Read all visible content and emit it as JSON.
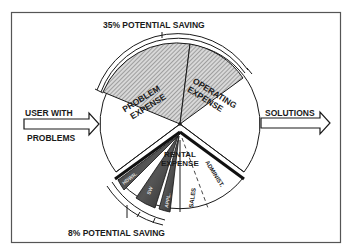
{
  "diagram": {
    "top_saving_label": "35% POTENTIAL SAVING",
    "bottom_saving_label": "8% POTENTIAL SAVING",
    "input_arrow": {
      "line1": "USER WITH",
      "line2": "PROBLEMS"
    },
    "output_arrow": {
      "label": "SOLUTIONS"
    },
    "pie": {
      "segments": [
        {
          "id": "problem",
          "line1": "PROBLEM",
          "line2": "EXPENSE",
          "style": "hatched"
        },
        {
          "id": "operating",
          "line1": "OPERATING",
          "line2": "EXPENSE",
          "style": "hatched"
        },
        {
          "id": "rental",
          "line1": "RENTAL",
          "line2": "EXPENSE",
          "style": "exploded"
        }
      ],
      "rental_subsegments": [
        {
          "label": "HDWR.",
          "style": "dark"
        },
        {
          "label": "SW",
          "style": "dark"
        },
        {
          "label": "APPL.",
          "style": "dark"
        },
        {
          "label": "SALES",
          "style": "plain"
        },
        {
          "label": "ADMINIST.",
          "style": "plain"
        }
      ]
    },
    "colors": {
      "ink": "#1a1a1a",
      "hatch": "#8a8a8a",
      "dark_fill": "#3a3a3a",
      "background": "#ffffff"
    }
  }
}
